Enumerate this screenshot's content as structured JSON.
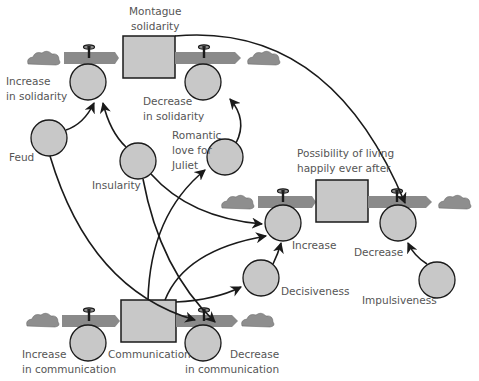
{
  "diagram": {
    "type": "stock-and-flow",
    "colors": {
      "background": "#ffffff",
      "stock_fill": "#c8c8c8",
      "converter_fill": "#c8c8c8",
      "pipe_fill": "#8a8a8a",
      "cloud_fill": "#8e8e8e",
      "line": "#1a1a1a",
      "label": "#555555"
    },
    "stocks": [
      {
        "id": "montague",
        "label": "Montague\nsolidarity"
      },
      {
        "id": "happily",
        "label": "Possibility of living\nhappily ever after"
      },
      {
        "id": "communication",
        "label": "Communication"
      }
    ],
    "flows": [
      {
        "id": "inc_solidarity",
        "label": "Increase\nin solidarity"
      },
      {
        "id": "dec_solidarity",
        "label": "Decrease\nin solidarity"
      },
      {
        "id": "increase",
        "label": "Increase"
      },
      {
        "id": "decrease",
        "label": "Decrease"
      },
      {
        "id": "inc_comm",
        "label": "Increase\nin communication"
      },
      {
        "id": "dec_comm",
        "label": "Decrease\nin communication"
      }
    ],
    "converters": [
      {
        "id": "feud",
        "label": "Feud"
      },
      {
        "id": "insularity",
        "label": "Insularity"
      },
      {
        "id": "romantic",
        "label": "Romantic\nlove for\nJuliet"
      },
      {
        "id": "decisiveness",
        "label": "Decisiveness"
      },
      {
        "id": "impulsiveness",
        "label": "Impulsiveness"
      }
    ],
    "links": [
      {
        "from": "Feud",
        "to": "Increase in solidarity"
      },
      {
        "from": "Insularity",
        "to": "Increase in solidarity"
      },
      {
        "from": "Romantic love for Juliet",
        "to": "Decrease in solidarity"
      },
      {
        "from": "Montague solidarity",
        "to": "Decrease (happily ever after)"
      },
      {
        "from": "Insularity",
        "to": "Increase (happily ever after)"
      },
      {
        "from": "Insularity",
        "to": "Decrease in communication"
      },
      {
        "from": "Feud",
        "to": "Decrease in communication"
      },
      {
        "from": "Communication",
        "to": "Romantic love for Juliet"
      },
      {
        "from": "Communication",
        "to": "Increase (happily ever after)"
      },
      {
        "from": "Communication",
        "to": "Decisiveness"
      },
      {
        "from": "Decisiveness",
        "to": "Increase (happily ever after)"
      },
      {
        "from": "Impulsiveness",
        "to": "Decrease (happily ever after)"
      }
    ]
  }
}
